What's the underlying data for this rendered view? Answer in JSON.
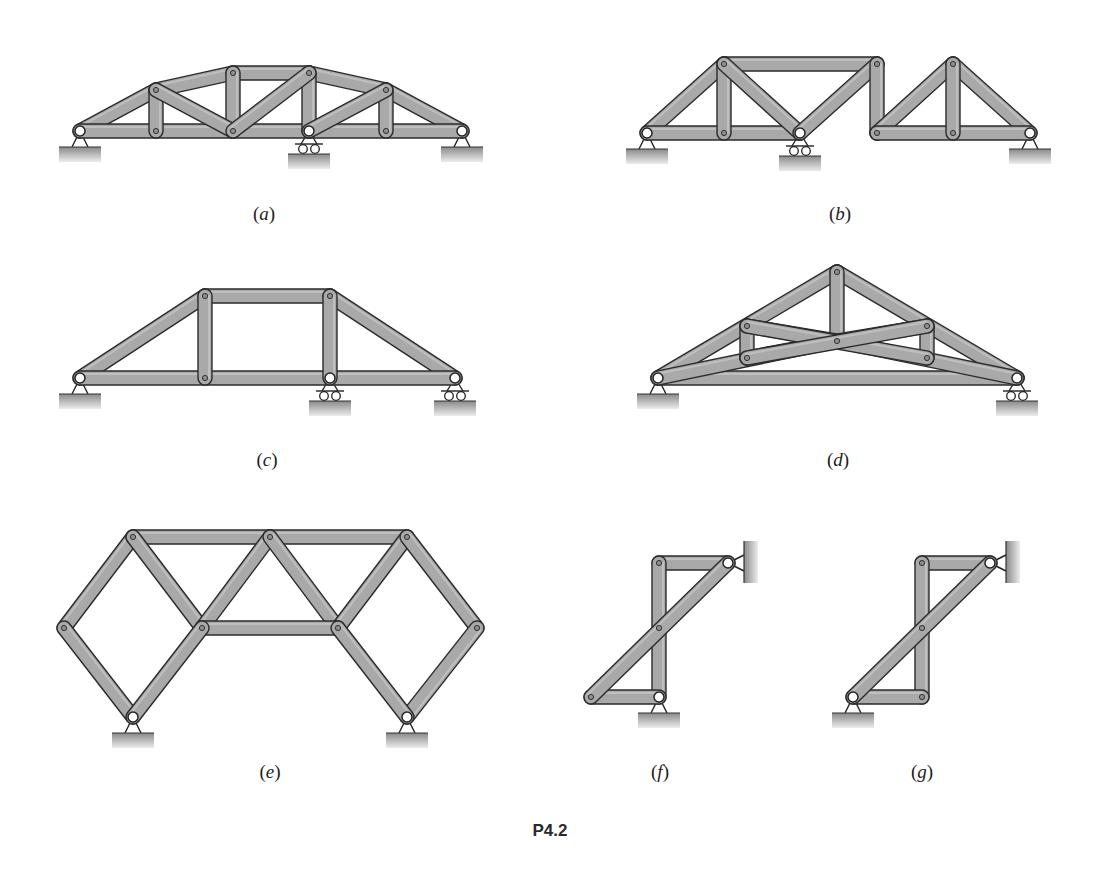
{
  "figure": {
    "caption": "P4.2",
    "member_color": "#a9a9a9",
    "member_edge_color": "#2b2b2b",
    "ground_color_top": "#8c8c8c",
    "ground_color_bottom": "#e6e6e6",
    "member_width": 14
  },
  "trusses": [
    {
      "id": "a",
      "label": "a",
      "label_pos": [
        264,
        217
      ],
      "joints": {
        "A": [
          80,
          131
        ],
        "B": [
          156,
          90
        ],
        "C": [
          233,
          73
        ],
        "D": [
          309,
          73
        ],
        "E": [
          386,
          90
        ],
        "F": [
          462,
          131
        ],
        "G": [
          156,
          131
        ],
        "H": [
          233,
          131
        ],
        "I": [
          309,
          131
        ],
        "J": [
          386,
          131
        ]
      },
      "members": [
        [
          "A",
          "B"
        ],
        [
          "B",
          "C"
        ],
        [
          "C",
          "D"
        ],
        [
          "D",
          "E"
        ],
        [
          "E",
          "F"
        ],
        [
          "A",
          "F"
        ],
        [
          "B",
          "G"
        ],
        [
          "C",
          "H"
        ],
        [
          "D",
          "I"
        ],
        [
          "E",
          "J"
        ],
        [
          "B",
          "H"
        ],
        [
          "H",
          "D"
        ],
        [
          "I",
          "E"
        ]
      ],
      "pins": [
        "A",
        "I",
        "F"
      ],
      "supports": [
        {
          "joint": "A",
          "type": "pin"
        },
        {
          "joint": "I",
          "type": "roller"
        },
        {
          "joint": "F",
          "type": "pin"
        }
      ]
    },
    {
      "id": "b",
      "label": "b",
      "label_pos": [
        840,
        217
      ],
      "joints": {
        "A": [
          647,
          133
        ],
        "B": [
          724,
          64
        ],
        "C": [
          724,
          133
        ],
        "D": [
          800,
          133
        ],
        "E": [
          877,
          64
        ],
        "F": [
          877,
          133
        ],
        "G": [
          953,
          64
        ],
        "H": [
          953,
          133
        ],
        "I": [
          1030,
          133
        ]
      },
      "members": [
        [
          "A",
          "B"
        ],
        [
          "B",
          "E"
        ],
        [
          "A",
          "D"
        ],
        [
          "B",
          "C"
        ],
        [
          "B",
          "D"
        ],
        [
          "D",
          "E"
        ],
        [
          "E",
          "F"
        ],
        [
          "F",
          "G"
        ],
        [
          "G",
          "I"
        ],
        [
          "F",
          "I"
        ],
        [
          "G",
          "H"
        ]
      ],
      "pins": [
        "A",
        "D",
        "I"
      ],
      "supports": [
        {
          "joint": "A",
          "type": "pin"
        },
        {
          "joint": "D",
          "type": "roller"
        },
        {
          "joint": "I",
          "type": "pin"
        }
      ]
    },
    {
      "id": "c",
      "label": "c",
      "label_pos": [
        267,
        463
      ],
      "joints": {
        "A": [
          80,
          378
        ],
        "B": [
          205,
          296
        ],
        "C": [
          330,
          296
        ],
        "D": [
          455,
          378
        ],
        "E": [
          205,
          378
        ],
        "F": [
          330,
          378
        ]
      },
      "members": [
        [
          "A",
          "B"
        ],
        [
          "B",
          "C"
        ],
        [
          "C",
          "D"
        ],
        [
          "A",
          "D"
        ],
        [
          "B",
          "E"
        ],
        [
          "C",
          "F"
        ]
      ],
      "pins": [
        "A",
        "F",
        "D"
      ],
      "supports": [
        {
          "joint": "A",
          "type": "pin"
        },
        {
          "joint": "F",
          "type": "roller"
        },
        {
          "joint": "D",
          "type": "roller"
        }
      ]
    },
    {
      "id": "d",
      "label": "d",
      "label_pos": [
        838,
        463
      ],
      "joints": {
        "A": [
          658,
          378
        ],
        "B": [
          747,
          326
        ],
        "C": [
          837,
          272
        ],
        "D": [
          927,
          326
        ],
        "E": [
          1017,
          378
        ],
        "F": [
          747,
          358
        ],
        "G": [
          837,
          341
        ],
        "H": [
          927,
          358
        ]
      },
      "members": [
        [
          "A",
          "C"
        ],
        [
          "C",
          "E"
        ],
        [
          "A",
          "E"
        ],
        [
          "A",
          "G"
        ],
        [
          "G",
          "E"
        ],
        [
          "B",
          "F"
        ],
        [
          "D",
          "H"
        ],
        [
          "C",
          "G"
        ],
        [
          "B",
          "G"
        ],
        [
          "G",
          "D"
        ],
        [
          "F",
          "G"
        ],
        [
          "B",
          "H"
        ],
        [
          "F",
          "D"
        ]
      ],
      "pins": [
        "A",
        "E"
      ],
      "supports": [
        {
          "joint": "A",
          "type": "pin"
        },
        {
          "joint": "E",
          "type": "roller"
        }
      ]
    },
    {
      "id": "e",
      "label": "e",
      "label_pos": [
        270,
        775
      ],
      "joints": {
        "A": [
          64,
          628
        ],
        "B": [
          133,
          537
        ],
        "C": [
          202,
          628
        ],
        "D": [
          133,
          717
        ],
        "E": [
          270,
          537
        ],
        "F": [
          338,
          628
        ],
        "G": [
          407,
          537
        ],
        "H": [
          477,
          628
        ],
        "I": [
          407,
          717
        ]
      },
      "members": [
        [
          "A",
          "B"
        ],
        [
          "A",
          "D"
        ],
        [
          "B",
          "E"
        ],
        [
          "E",
          "G"
        ],
        [
          "B",
          "C"
        ],
        [
          "C",
          "E"
        ],
        [
          "E",
          "F"
        ],
        [
          "F",
          "G"
        ],
        [
          "G",
          "H"
        ],
        [
          "H",
          "I"
        ],
        [
          "C",
          "F"
        ],
        [
          "D",
          "C"
        ],
        [
          "F",
          "I"
        ]
      ],
      "pins": [
        "D",
        "I"
      ],
      "supports": [
        {
          "joint": "D",
          "type": "pin"
        },
        {
          "joint": "I",
          "type": "pin"
        }
      ]
    },
    {
      "id": "f",
      "label": "f",
      "label_pos": [
        660,
        775
      ],
      "joints": {
        "A": [
          659,
          563
        ],
        "B": [
          728,
          563
        ],
        "C": [
          659,
          628
        ],
        "D": [
          659,
          697
        ],
        "E": [
          591,
          697
        ]
      },
      "members": [
        [
          "A",
          "B"
        ],
        [
          "A",
          "D"
        ],
        [
          "E",
          "D"
        ],
        [
          "E",
          "B"
        ]
      ],
      "pins": [
        "B",
        "D"
      ],
      "supports": [
        {
          "joint": "B",
          "type": "wall-pin-right"
        },
        {
          "joint": "D",
          "type": "pin"
        }
      ]
    },
    {
      "id": "g",
      "label": "g",
      "label_pos": [
        922,
        775
      ],
      "joints": {
        "A": [
          922,
          563
        ],
        "B": [
          990,
          563
        ],
        "C": [
          922,
          628
        ],
        "D": [
          922,
          697
        ],
        "E": [
          853,
          697
        ]
      },
      "members": [
        [
          "A",
          "B"
        ],
        [
          "A",
          "D"
        ],
        [
          "E",
          "D"
        ],
        [
          "E",
          "B"
        ]
      ],
      "pins": [
        "B",
        "E"
      ],
      "supports": [
        {
          "joint": "B",
          "type": "wall-pin-right"
        },
        {
          "joint": "E",
          "type": "pin"
        }
      ]
    }
  ],
  "caption_pos": [
    550,
    833
  ]
}
